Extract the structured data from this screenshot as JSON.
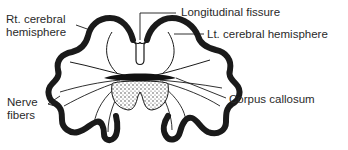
{
  "diagram": {
    "type": "anatomical cross-section",
    "labels": {
      "rt_hemisphere": [
        "Rt. cerebral",
        "hemisphere"
      ],
      "longitudinal_fissure": "Longitudinal fissure",
      "lt_hemisphere": "Lt. cerebral hemisphere",
      "nerve_fibers": [
        "Nerve",
        "fibers"
      ],
      "corpus_callosum": "Corpus callosum"
    },
    "colors": {
      "ink": "#1a1a1a",
      "background": "#ffffff",
      "stipple_fill": "#d8d8d8"
    }
  }
}
